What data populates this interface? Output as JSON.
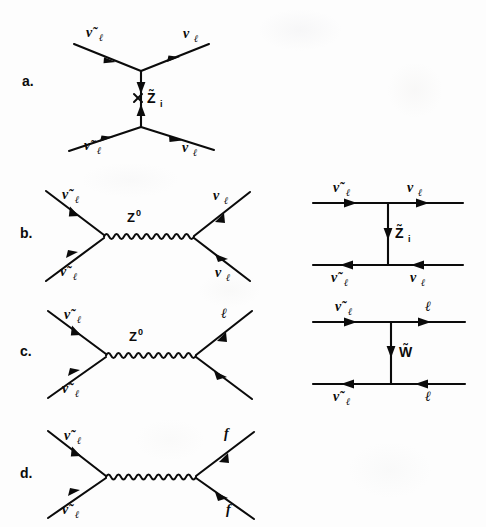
{
  "figure": {
    "background_color": "#fdfdfd",
    "ink_color": "#0b0b0b"
  },
  "panels": [
    {
      "id": "a",
      "letter": "a.",
      "topology": "t-channel with Majorana mass insertion",
      "propagator_type": "fermion",
      "propagator_label": "Z̃",
      "propagator_sub": "i",
      "has_mass_insertion_cross": true,
      "legs": {
        "top_left": "ν̃",
        "top_left_sub": "ℓ",
        "top_right": "ν",
        "top_right_sub": "ℓ",
        "bottom_left": "ν̃",
        "bottom_left_sub": "ℓ",
        "bottom_right": "ν",
        "bottom_right_sub": "ℓ"
      }
    },
    {
      "id": "b",
      "letter": "b.",
      "topology": "s-channel Z boson exchange",
      "propagator_type": "wavy",
      "propagator_label": "Z",
      "propagator_sup": "0",
      "legs": {
        "top_left": "ν̃",
        "top_left_sub": "ℓ",
        "top_right": "ν",
        "top_right_sub": "ℓ",
        "bottom_left": "ν̃",
        "bottom_left_sub": "ℓ",
        "bottom_right": "ν",
        "bottom_right_sub": "ℓ"
      },
      "partner": {
        "topology": "t-channel neutralino exchange",
        "propagator_label": "Z̃",
        "propagator_sub": "i",
        "legs": {
          "top_left": "ν̃",
          "top_left_sub": "ℓ",
          "top_right": "ν",
          "top_right_sub": "ℓ",
          "bottom_left": "ν̃",
          "bottom_left_sub": "ℓ",
          "bottom_right": "ν",
          "bottom_right_sub": "ℓ"
        }
      }
    },
    {
      "id": "c",
      "letter": "c.",
      "topology": "s-channel Z boson exchange to charged leptons",
      "propagator_type": "wavy",
      "propagator_label": "Z",
      "propagator_sup": "0",
      "legs": {
        "top_left": "ν̃",
        "top_left_sub": "ℓ",
        "top_right": "ℓ",
        "top_right_sub": "",
        "bottom_left": "ν̃",
        "bottom_left_sub": "ℓ",
        "bottom_right": "",
        "bottom_right_sub": ""
      },
      "partner": {
        "topology": "t-channel chargino exchange",
        "propagator_label": "W̃",
        "propagator_sub": "",
        "legs": {
          "top_left": "ν̃",
          "top_left_sub": "ℓ",
          "top_right": "ℓ",
          "top_right_sub": "",
          "bottom_left": "ν̃",
          "bottom_left_sub": "ℓ",
          "bottom_right": "ℓ",
          "bottom_right_sub": ""
        }
      }
    },
    {
      "id": "d",
      "letter": "d.",
      "topology": "s-channel boson exchange to generic fermions",
      "propagator_type": "wavy",
      "propagator_label": "",
      "propagator_sup": "",
      "legs": {
        "top_left": "ν̃",
        "top_left_sub": "ℓ",
        "top_right": "f",
        "top_right_sub": "",
        "bottom_left": "ν̃",
        "bottom_left_sub": "ℓ",
        "bottom_right": "f",
        "bottom_right_sub": ""
      }
    }
  ]
}
